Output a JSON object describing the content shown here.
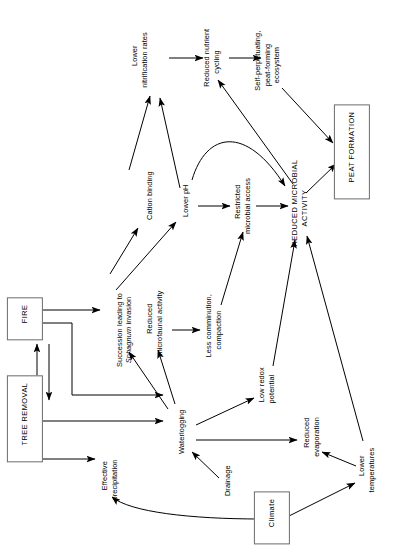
{
  "diagram": {
    "orientation": "rotated-90-ccw",
    "line_color": "#000000",
    "box_border_color": "#6b6b6b",
    "background": "#ffffff",
    "nodes": [
      {
        "id": "fire",
        "label": "FIRE",
        "style": "boxed-caps",
        "x": 25,
        "y": 319,
        "w": 50,
        "h": 20
      },
      {
        "id": "tree_removal",
        "label": "TREE REMOVAL",
        "style": "boxed-caps",
        "x": 25,
        "y": 419,
        "w": 94,
        "h": 20
      },
      {
        "id": "succession",
        "label": "Succession leading to\nSphagnum invasion",
        "style": "plain-italic2",
        "x": 124,
        "y": 330,
        "w": 100,
        "h": 20
      },
      {
        "id": "cation_binding",
        "label": "Cation binding",
        "style": "plain",
        "x": 150,
        "y": 200,
        "w": 70,
        "h": 12
      },
      {
        "id": "lower_ph",
        "label": "Lower pH",
        "style": "plain",
        "x": 186,
        "y": 205,
        "w": 46,
        "h": 12
      },
      {
        "id": "lower_nitrif",
        "label": "Lower\nnitrification rates",
        "style": "plain",
        "x": 140,
        "y": 60,
        "w": 76,
        "h": 20
      },
      {
        "id": "reduced_nutrient",
        "label": "Reduced nutrient\ncycling",
        "style": "plain",
        "x": 212,
        "y": 62,
        "w": 76,
        "h": 20
      },
      {
        "id": "self_perp",
        "label": "Self-perpetuating,\npeat-forming\necosystem",
        "style": "plain",
        "x": 268,
        "y": 65,
        "w": 78,
        "h": 30
      },
      {
        "id": "peat_formation",
        "label": "PEAT FORMATION",
        "style": "boxed-caps",
        "x": 352,
        "y": 152,
        "w": 118,
        "h": 22
      },
      {
        "id": "reduced_micro",
        "label": "REDUCED MICROBIAL\nACTIVITY",
        "style": "plain-caps",
        "x": 300,
        "y": 208,
        "w": 110,
        "h": 22
      },
      {
        "id": "restricted_acc",
        "label": "Restricted\nmicrobial access",
        "style": "plain",
        "x": 243,
        "y": 206,
        "w": 72,
        "h": 20
      },
      {
        "id": "less_comm",
        "label": "Less comminution,\ncompaction",
        "style": "plain",
        "x": 214,
        "y": 330,
        "w": 80,
        "h": 20
      },
      {
        "id": "reduced_faunal",
        "label": "Reduced\nmicrofaunal activity",
        "style": "plain",
        "x": 155,
        "y": 323,
        "w": 88,
        "h": 20
      },
      {
        "id": "waterlogging",
        "label": "Waterlogging",
        "style": "plain",
        "x": 182,
        "y": 436,
        "w": 60,
        "h": 12
      },
      {
        "id": "low_redox",
        "label": "Low redox\npotential",
        "style": "plain",
        "x": 267,
        "y": 389,
        "w": 48,
        "h": 20
      },
      {
        "id": "reduced_evap",
        "label": "Reduced\nevaporation",
        "style": "plain",
        "x": 312,
        "y": 437,
        "w": 54,
        "h": 20
      },
      {
        "id": "lower_temps",
        "label": "Lower\ntemperatures",
        "style": "plain",
        "x": 367,
        "y": 470,
        "w": 60,
        "h": 20
      },
      {
        "id": "drainage",
        "label": "Drainage",
        "style": "plain",
        "x": 228,
        "y": 485,
        "w": 44,
        "h": 12
      },
      {
        "id": "eff_precip",
        "label": "Effective\nprecipitation",
        "style": "plain",
        "x": 110,
        "y": 480,
        "w": 56,
        "h": 20
      },
      {
        "id": "climate",
        "label": "Climate",
        "style": "boxed",
        "x": 272,
        "y": 518,
        "w": 48,
        "h": 20
      }
    ],
    "edges": [
      {
        "from": "tree_removal",
        "to": "fire",
        "kind": "straight-vertical"
      },
      {
        "from": "fire",
        "to": "tree_removal",
        "kind": "straight-vertical"
      },
      {
        "from": "fire",
        "to": "succession",
        "kind": "straight"
      },
      {
        "from": "fire",
        "to": "waterlogging",
        "kind": "orthogonal"
      },
      {
        "from": "tree_removal",
        "to": "waterlogging",
        "kind": "straight"
      },
      {
        "from": "tree_removal",
        "to": "eff_precip",
        "kind": "straight"
      },
      {
        "from": "succession",
        "to": "cation_binding",
        "kind": "straight"
      },
      {
        "from": "succession",
        "to": "lower_ph",
        "kind": "straight"
      },
      {
        "from": "cation_binding",
        "to": "lower_nitrif",
        "kind": "straight"
      },
      {
        "from": "lower_ph",
        "to": "lower_nitrif",
        "kind": "straight"
      },
      {
        "from": "lower_ph",
        "to": "restricted_acc",
        "kind": "straight"
      },
      {
        "from": "lower_ph",
        "to": "reduced_micro",
        "kind": "curved"
      },
      {
        "from": "lower_nitrif",
        "to": "reduced_nutrient",
        "kind": "straight"
      },
      {
        "from": "reduced_nutrient",
        "to": "self_perp",
        "kind": "straight"
      },
      {
        "from": "self_perp",
        "to": "peat_formation",
        "kind": "straight"
      },
      {
        "from": "reduced_micro",
        "to": "peat_formation",
        "kind": "straight"
      },
      {
        "from": "reduced_micro",
        "to": "reduced_nutrient",
        "kind": "straight"
      },
      {
        "from": "restricted_acc",
        "to": "reduced_micro",
        "kind": "straight"
      },
      {
        "from": "less_comm",
        "to": "restricted_acc",
        "kind": "straight"
      },
      {
        "from": "reduced_faunal",
        "to": "less_comm",
        "kind": "straight"
      },
      {
        "from": "waterlogging",
        "to": "reduced_faunal",
        "kind": "straight"
      },
      {
        "from": "waterlogging",
        "to": "succession",
        "kind": "straight"
      },
      {
        "from": "waterlogging",
        "to": "low_redox",
        "kind": "straight"
      },
      {
        "from": "waterlogging",
        "to": "reduced_evap",
        "kind": "straight"
      },
      {
        "from": "low_redox",
        "to": "reduced_micro",
        "kind": "straight"
      },
      {
        "from": "lower_temps",
        "to": "reduced_micro",
        "kind": "straight"
      },
      {
        "from": "lower_temps",
        "to": "reduced_evap",
        "kind": "straight"
      },
      {
        "from": "drainage",
        "to": "waterlogging",
        "kind": "straight"
      },
      {
        "from": "climate",
        "to": "lower_temps",
        "kind": "straight"
      },
      {
        "from": "climate",
        "to": "eff_precip",
        "kind": "curved"
      }
    ]
  }
}
